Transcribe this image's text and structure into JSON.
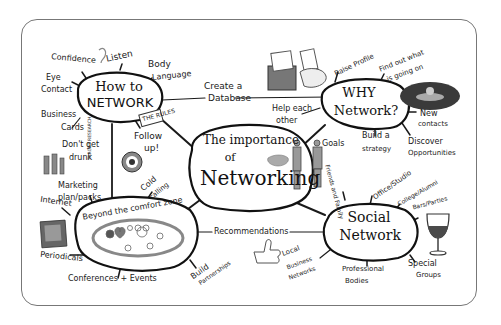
{
  "central": {
    "title_line1": "The importance",
    "title_line2": "of",
    "title_line3": "Networking"
  },
  "nodes": {
    "how_to_network": {
      "line1": "How to",
      "line2": "NETWORK",
      "tag": "THE RULES",
      "branches": [
        "Confidence",
        "Listen",
        "Body",
        "Language",
        "Eye",
        "Contact",
        "Business",
        "Cards",
        "Don't get",
        "drunk",
        "Follow",
        "up!",
        "TARGET RESEARCH"
      ]
    },
    "why_network": {
      "line1": "WHY",
      "line2": "Network?",
      "branches": [
        "Raise Profile",
        "Find out what",
        "is going on",
        "Help each",
        "other",
        "New",
        "contacts",
        "Goals",
        "Build a",
        "strategy",
        "Discover",
        "Opportunities"
      ]
    },
    "beyond_comfort": {
      "label": "Beyond the comfort zone",
      "branches": [
        "Internet",
        "Marketing",
        "plan/packs",
        "Periodicals",
        "Conferences + Events",
        "Cold",
        "calling",
        "Build",
        "Partnerships"
      ]
    },
    "social_network": {
      "line1": "Social",
      "line2": "Network",
      "branches": [
        "Friends and Family",
        "Office/Studio",
        "College/Alumni",
        "Bars/Parties",
        "Special",
        "Groups",
        "Professional",
        "Bodies",
        "Local",
        "Business",
        "Networks"
      ]
    },
    "links": {
      "create_db_1": "Create a",
      "create_db_2": "Database",
      "recommendations": "Recommendations"
    }
  }
}
